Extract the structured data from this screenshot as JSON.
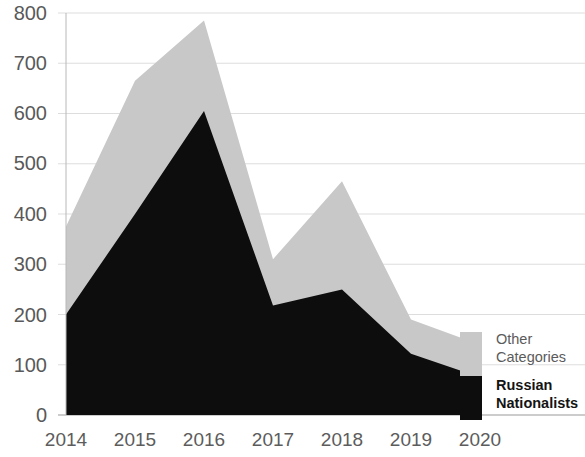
{
  "chart_data": {
    "type": "area",
    "title": "",
    "subtitle": "",
    "xlabel": "",
    "ylabel": "",
    "stacked": true,
    "grid": true,
    "grid_axis": "y",
    "legend_position": "right",
    "categories": [
      "2014",
      "2015",
      "2016",
      "2017",
      "2018",
      "2019",
      "2020"
    ],
    "x": [
      2014,
      2015,
      2016,
      2017,
      2018,
      2019,
      2020
    ],
    "xlim": [
      2014,
      2020
    ],
    "ylim": [
      0,
      800
    ],
    "y_ticks": [
      0,
      100,
      200,
      300,
      400,
      500,
      600,
      700,
      800
    ],
    "y_tick_labels": [
      "0",
      "100",
      "200",
      "300",
      "400",
      "500",
      "600",
      "700",
      "800"
    ],
    "series": [
      {
        "name": "Russian Nationalists",
        "color": "#0d0d0d",
        "values": [
          200,
          400,
          605,
          218,
          250,
          122,
          75
        ]
      },
      {
        "name": "Other Categories",
        "color": "#c8c8c8",
        "values": [
          175,
          265,
          180,
          92,
          215,
          68,
          65
        ]
      }
    ],
    "cumulative_totals": [
      375,
      665,
      785,
      310,
      465,
      190,
      140
    ]
  },
  "axes": {
    "y_ticks": [
      {
        "label": "800",
        "value": 800
      },
      {
        "label": "700",
        "value": 700
      },
      {
        "label": "600",
        "value": 600
      },
      {
        "label": "500",
        "value": 500
      },
      {
        "label": "400",
        "value": 400
      },
      {
        "label": "300",
        "value": 300
      },
      {
        "label": "200",
        "value": 200
      },
      {
        "label": "100",
        "value": 100
      },
      {
        "label": "0",
        "value": 0
      }
    ],
    "x_ticks": [
      {
        "label": "2014",
        "value": 2014
      },
      {
        "label": "2015",
        "value": 2015
      },
      {
        "label": "2016",
        "value": 2016
      },
      {
        "label": "2017",
        "value": 2017
      },
      {
        "label": "2018",
        "value": 2018
      },
      {
        "label": "2019",
        "value": 2019
      },
      {
        "label": "2020",
        "value": 2020
      }
    ]
  },
  "legend": {
    "entries": [
      {
        "label_line1": "Other",
        "label_line2": "Categories",
        "color": "#c8c8c8"
      },
      {
        "label_line1": "Russian",
        "label_line2": "Nationalists",
        "color": "#0d0d0d"
      }
    ]
  },
  "colors": {
    "background": "#ffffff",
    "grid": "#d9d9d9",
    "tick_text": "#595959",
    "series_other": "#c8c8c8",
    "series_russian": "#0d0d0d"
  }
}
